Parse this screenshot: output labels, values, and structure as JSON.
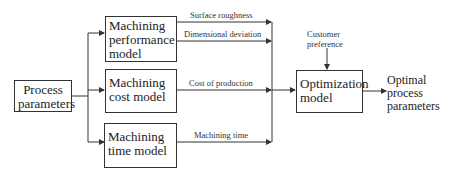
{
  "diagram": {
    "type": "block-flow",
    "input": {
      "label_lines": [
        "Process",
        "parameters"
      ]
    },
    "models": [
      {
        "id": "performance",
        "label_lines": [
          "Machining",
          "performance",
          "model"
        ],
        "outputs": [
          "Surface roughness",
          "Dimensional deviation"
        ]
      },
      {
        "id": "cost",
        "label_lines": [
          "Machining",
          "cost model"
        ],
        "outputs": [
          "Cost of production"
        ]
      },
      {
        "id": "time",
        "label_lines": [
          "Machining",
          "time model"
        ],
        "outputs": [
          "Machining time"
        ]
      }
    ],
    "optimizer": {
      "label_lines": [
        "Optimization",
        "model"
      ],
      "extra_input_lines": [
        "Customer",
        "preference"
      ]
    },
    "result": {
      "label_lines": [
        "Optimal",
        "process",
        "parameters"
      ]
    }
  },
  "colors": {
    "line": "#333333",
    "text": "#222222",
    "background": "#ffffff"
  }
}
